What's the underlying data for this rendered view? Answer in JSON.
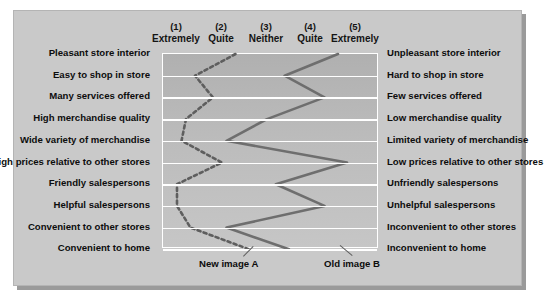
{
  "chart_data": {
    "type": "line",
    "title": "",
    "subtitle": "",
    "xlabel": "",
    "ylabel": "",
    "orientation": "horizontal-semantic-differential",
    "grid": true,
    "legend_position": "bottom",
    "xlim": [
      1,
      5
    ],
    "scale": [
      {
        "number": "(1)",
        "word": "Extremely"
      },
      {
        "number": "(2)",
        "word": "Quite"
      },
      {
        "number": "(3)",
        "word": "Neither"
      },
      {
        "number": "(4)",
        "word": "Quite"
      },
      {
        "number": "(5)",
        "word": "Extremely"
      }
    ],
    "categories": [
      "Pleasant store interior",
      "Easy to shop in store",
      "Many services offered",
      "High merchandise quality",
      "Wide variety of merchandise",
      "High prices relative to other stores",
      "Friendly salespersons",
      "Helpful salespersons",
      "Convenient to other stores",
      "Convenient to home"
    ],
    "categories_right": [
      "Unpleasant store interior",
      "Hard to shop in store",
      "Few services offered",
      "Low merchandise quality",
      "Limited variety of merchandise",
      "Low prices relative to other stores",
      "Unfriendly salespersons",
      "Unhelpful salespersons",
      "Inconvenient to other stores",
      "Inconvenient to home"
    ],
    "series": [
      {
        "name": "New image A",
        "style": "dashed",
        "color": "#5e5e5e",
        "values": [
          2.3,
          1.4,
          1.8,
          1.2,
          1.1,
          2.0,
          1.0,
          1.0,
          1.3,
          2.6
        ]
      },
      {
        "name": "Old image B",
        "style": "solid",
        "color": "#6e6e6e",
        "values": [
          4.6,
          3.4,
          4.3,
          3.0,
          2.1,
          4.8,
          3.2,
          4.3,
          2.1,
          3.5
        ]
      }
    ]
  },
  "legend": {
    "series_a": "New image A",
    "series_b": "Old image B"
  },
  "colors": {
    "panel": "#c9c9c9",
    "plot_top": "#b0b0b0",
    "plot_bottom": "#c6c6c6",
    "gridline": "#ffffff",
    "line_a": "#5e5e5e",
    "line_b": "#6e6e6e",
    "text": "#0d0d0d"
  }
}
